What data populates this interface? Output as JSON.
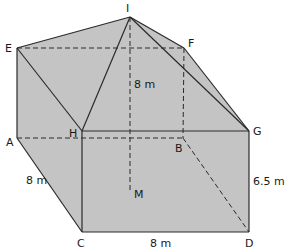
{
  "diagram": {
    "type": "3d-solid",
    "fill_color": "#c4c4c4",
    "line_color": "#2a2a2a",
    "vertices": {
      "I": {
        "label": "I",
        "x": 130,
        "y": 17
      },
      "E": {
        "label": "E",
        "x": 17,
        "y": 48
      },
      "F": {
        "label": "F",
        "x": 184,
        "y": 48
      },
      "H": {
        "label": "H",
        "x": 82,
        "y": 131
      },
      "G": {
        "label": "G",
        "x": 249,
        "y": 131
      },
      "A": {
        "label": "A",
        "x": 17,
        "y": 138
      },
      "B": {
        "label": "B",
        "x": 183,
        "y": 138
      },
      "C": {
        "label": "C",
        "x": 82,
        "y": 232
      },
      "D": {
        "label": "D",
        "x": 249,
        "y": 232
      },
      "M": {
        "label": "M",
        "x": 130,
        "y": 190
      }
    },
    "measurements": {
      "height_IM": "8 m",
      "edge_AC": "8 m",
      "edge_CD": "8 m",
      "edge_GD": "6.5 m"
    }
  }
}
